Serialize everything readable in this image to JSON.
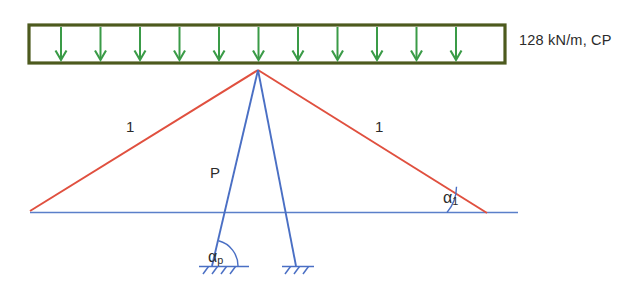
{
  "diagram": {
    "load_box": {
      "label": "128 kN/m, CP",
      "arrow_count": 11,
      "arrow_icon": "down-arrow-icon",
      "border_color": "#4d5a1e",
      "arrow_color": "#3a9b47"
    },
    "members": {
      "left_cable_label": "1",
      "right_cable_label": "1",
      "post_label": "P",
      "cable_color": "#e0503f",
      "post_color": "#4a6fc4",
      "ground_color": "#5a7fc9"
    },
    "angles": {
      "alpha_1": {
        "symbol": "α",
        "subscript": "1"
      },
      "alpha_p": {
        "symbol": "α",
        "subscript": "p"
      }
    },
    "supports": {
      "left": "pin-support-icon",
      "right": "pin-support-icon"
    }
  }
}
